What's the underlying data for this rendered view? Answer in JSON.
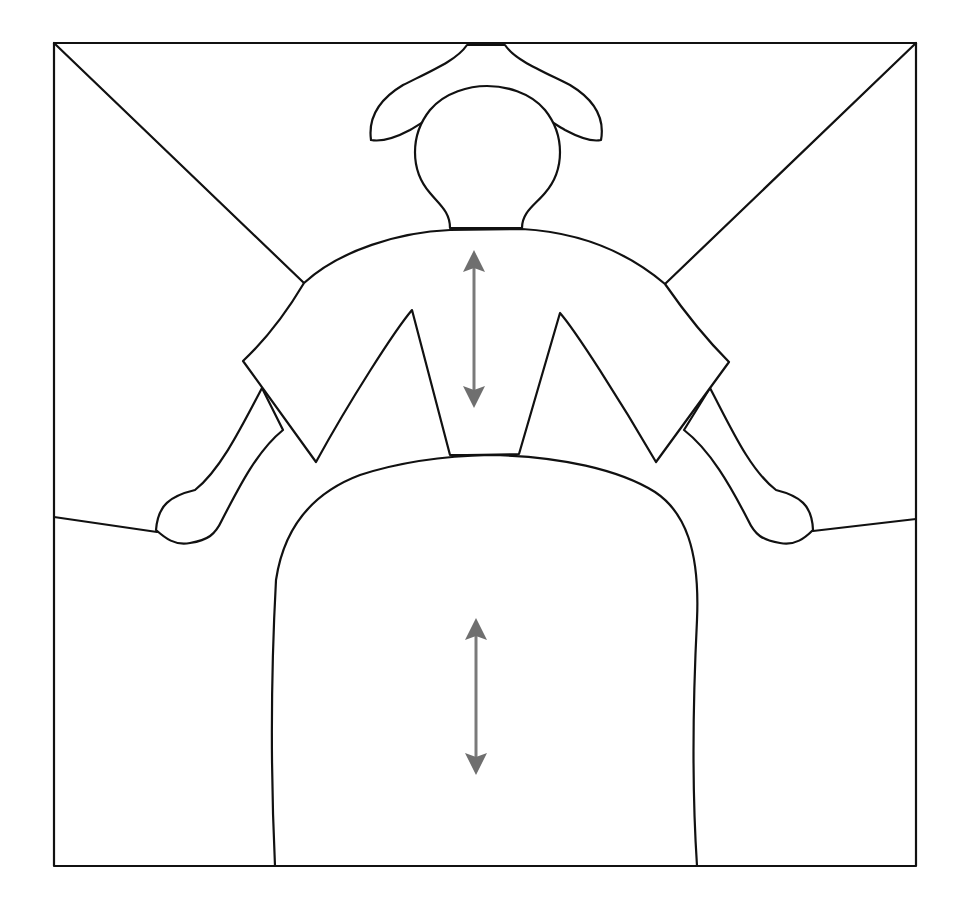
{
  "figure": {
    "colors": {
      "background": "#ffffff",
      "outline": "#111111",
      "arrow": "#7a7a7a"
    },
    "frame": {
      "x": 54,
      "y": 43,
      "width": 862,
      "height": 823
    },
    "arrows": [
      {
        "name": "upper-body-arrow",
        "x": 474,
        "y_top": 250,
        "y_bottom": 408,
        "direction": "vertical-bidirectional"
      },
      {
        "name": "lower-body-arrow",
        "x": 476,
        "y_top": 618,
        "y_bottom": 775,
        "direction": "vertical-bidirectional"
      }
    ]
  }
}
